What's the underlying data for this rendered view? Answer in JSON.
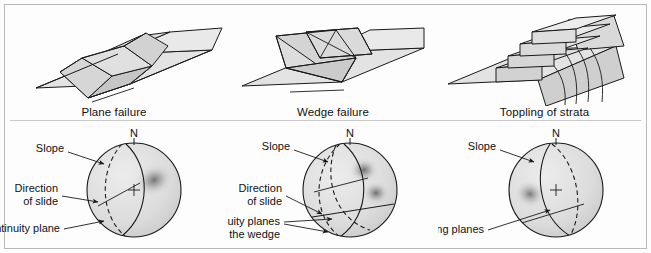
{
  "figure": {
    "background": "#fdfdfd",
    "border_color": "#b9b9b9",
    "line_color": "#1a1a1a",
    "block_fill": "#d9d9d9",
    "block_fill_light": "#e6e6e6",
    "block_fill_dark": "#c4c4c4",
    "net_fill": "#dcdcdc",
    "density_color": "#6b6b6b"
  },
  "panels": [
    {
      "id": "plane-failure",
      "caption": "Plane failure",
      "north_label": "N",
      "block": {
        "name": "plane-failure-block",
        "description": "isometric rock slab sliding on a single planar discontinuity"
      },
      "stereonet": {
        "name": "plane-failure-stereonet",
        "great_circles": [
          {
            "name": "slope-great-circle",
            "style": "solid"
          },
          {
            "name": "discontinuity-great-circle",
            "style": "dashed"
          }
        ],
        "density_blobs": [
          {
            "name": "pole-concentration",
            "cx": 0.42,
            "cy": -0.22,
            "r": 0.42
          }
        ],
        "labels": [
          {
            "name": "slope-label",
            "text": "Slope",
            "lines": [
              "Slope"
            ]
          },
          {
            "name": "direction-of-slide-label",
            "text": "Direction of slide",
            "lines": [
              "Direction",
              "of slide"
            ]
          },
          {
            "name": "discontinuity-plane-label",
            "text": "Discontinuity plane",
            "lines": [
              "Discontinuity plane"
            ]
          }
        ]
      }
    },
    {
      "id": "wedge-failure",
      "caption": "Wedge failure",
      "north_label": "N",
      "block": {
        "name": "wedge-failure-block",
        "description": "isometric tetrahedral wedge formed by two intersecting discontinuity planes"
      },
      "stereonet": {
        "name": "wedge-failure-stereonet",
        "great_circles": [
          {
            "name": "slope-great-circle",
            "style": "solid"
          },
          {
            "name": "discontinuity-great-circle-1",
            "style": "dashed"
          },
          {
            "name": "discontinuity-great-circle-2",
            "style": "dashed"
          },
          {
            "name": "wedge-intersection-great-circle",
            "style": "solid"
          }
        ],
        "density_blobs": [
          {
            "name": "pole-concentration-1",
            "cx": 0.3,
            "cy": -0.4,
            "r": 0.34
          },
          {
            "name": "pole-concentration-2",
            "cx": 0.52,
            "cy": 0.02,
            "r": 0.34
          }
        ],
        "labels": [
          {
            "name": "slope-label",
            "text": "Slope",
            "lines": [
              "Slope"
            ]
          },
          {
            "name": "direction-of-slide-label",
            "text": "Direction of slide",
            "lines": [
              "Direction",
              "of slide"
            ]
          },
          {
            "name": "discontinuity-planes-label",
            "text": "Discontinuity planes forming the wedge",
            "lines": [
              "Discontinuity planes",
              "forming the wedge"
            ]
          }
        ]
      }
    },
    {
      "id": "toppling-of-strata",
      "caption": "Toppling of strata",
      "north_label": "N",
      "block": {
        "name": "toppling-block",
        "description": "isometric stepped stack of steeply dipping strata toppling outward"
      },
      "stereonet": {
        "name": "toppling-stereonet",
        "great_circles": [
          {
            "name": "slope-great-circle",
            "style": "solid"
          },
          {
            "name": "bedding-great-circle",
            "style": "dashed"
          }
        ],
        "density_blobs": [
          {
            "name": "pole-concentration",
            "cx": -0.52,
            "cy": 0.06,
            "r": 0.36
          }
        ],
        "labels": [
          {
            "name": "slope-label",
            "text": "Slope",
            "lines": [
              "Slope"
            ]
          },
          {
            "name": "bedding-planes-label",
            "text": "Bedding planes",
            "lines": [
              "Bedding planes"
            ]
          }
        ]
      }
    }
  ]
}
